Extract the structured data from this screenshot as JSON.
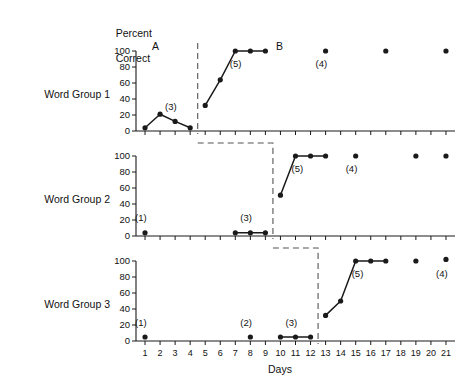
{
  "header": {
    "y_axis_title_line1": "Percent",
    "y_axis_title_line2": "Correct",
    "x_axis_title": "Days"
  },
  "phases": [
    {
      "name": "phase-a-label",
      "label": "A"
    },
    {
      "name": "phase-b-label",
      "label": "B"
    }
  ],
  "rows": [
    {
      "label": "Word Group 1"
    },
    {
      "label": "Word Group 2"
    },
    {
      "label": "Word Group 3"
    }
  ],
  "axes": {
    "y_ticks": [
      0,
      20,
      40,
      60,
      80,
      100
    ],
    "y_tick_labels": [
      "0",
      "20",
      "40",
      "60",
      "80",
      "100"
    ],
    "ylim": [
      0,
      100
    ],
    "x_ticks": [
      1,
      2,
      3,
      4,
      5,
      6,
      7,
      8,
      9,
      10,
      11,
      12,
      13,
      14,
      15,
      16,
      17,
      18,
      19,
      20,
      21
    ],
    "x_tick_labels": [
      "1",
      "2",
      "3",
      "4",
      "5",
      "6",
      "7",
      "8",
      "9",
      "10",
      "11",
      "12",
      "13",
      "14",
      "15",
      "16",
      "17",
      "18",
      "19",
      "20",
      "21"
    ],
    "xlim": [
      0.4,
      21.6
    ]
  },
  "colors": {
    "ink": "#1a1a1a",
    "dashed": "#555555",
    "background": "#ffffff"
  },
  "chart_data": {
    "type": "line",
    "xlabel": "Days",
    "ylabel": "Percent Correct",
    "ylim": [
      0,
      100
    ],
    "xlim": [
      0.4,
      21.6
    ],
    "grid": false,
    "legend": "none",
    "phase_labels": [
      "A",
      "B"
    ],
    "panels": [
      {
        "name": "Word Group 1",
        "segments": [
          {
            "phase": "A",
            "x": [
              1,
              2,
              3,
              4
            ],
            "y": [
              4,
              21,
              12,
              4
            ]
          },
          {
            "phase": "B",
            "x": [
              5,
              6,
              7,
              8,
              9
            ],
            "y": [
              32,
              64,
              100,
              100,
              100
            ]
          }
        ],
        "isolated_points": {
          "x": [
            13,
            17,
            21
          ],
          "y": [
            100,
            100,
            100
          ]
        },
        "annotations": [
          {
            "text": "(3)",
            "x": 3.0,
            "y": 30
          },
          {
            "text": "(5)",
            "x": 7.3,
            "y": 84
          },
          {
            "text": "(4)",
            "x": 13.0,
            "y": 84
          }
        ],
        "phase_line_x": 4.5
      },
      {
        "name": "Word Group 2",
        "segments": [
          {
            "phase": "A",
            "x": [
              7,
              8,
              9
            ],
            "y": [
              4,
              4,
              4
            ]
          },
          {
            "phase": "B",
            "x": [
              10,
              11,
              12,
              13
            ],
            "y": [
              51,
              100,
              100,
              100
            ]
          }
        ],
        "isolated_points": {
          "x": [
            15,
            19,
            21
          ],
          "y": [
            100,
            100,
            100
          ]
        },
        "annotations": [
          {
            "text": "(1)",
            "x": 1.0,
            "y": 22
          },
          {
            "text": "(3)",
            "x": 8.0,
            "y": 22
          },
          {
            "text": "(5)",
            "x": 11.4,
            "y": 84
          },
          {
            "text": "(4)",
            "x": 15.0,
            "y": 84
          }
        ],
        "baseline_point": {
          "x": 1,
          "y": 4
        },
        "phase_line_x": 9.5
      },
      {
        "name": "Word Group 3",
        "segments": [
          {
            "phase": "A",
            "x": [
              10,
              11,
              12
            ],
            "y": [
              5,
              5,
              5
            ]
          },
          {
            "phase": "B",
            "x": [
              13,
              14,
              15,
              16,
              17
            ],
            "y": [
              32,
              50,
              100,
              100,
              100
            ]
          }
        ],
        "isolated_points": {
          "x": [
            19,
            21
          ],
          "y": [
            100,
            102
          ]
        },
        "annotations": [
          {
            "text": "(1)",
            "x": 1.0,
            "y": 22
          },
          {
            "text": "(2)",
            "x": 8.0,
            "y": 22
          },
          {
            "text": "(3)",
            "x": 11.0,
            "y": 22
          },
          {
            "text": "(5)",
            "x": 15.4,
            "y": 84
          },
          {
            "text": "(4)",
            "x": 21.0,
            "y": 84
          }
        ],
        "baseline_points": {
          "x": [
            1,
            8
          ],
          "y": [
            5,
            5
          ]
        },
        "phase_line_x": 12.5
      }
    ]
  }
}
